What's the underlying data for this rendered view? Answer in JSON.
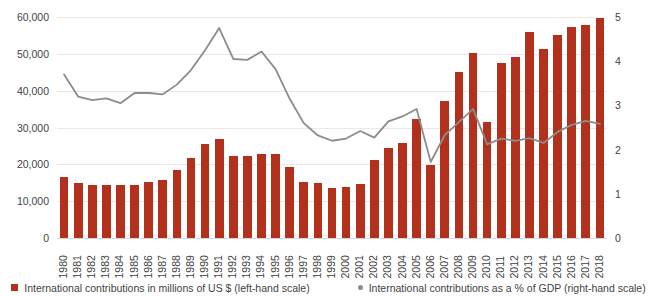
{
  "chart_data": {
    "type": "bar",
    "title": "",
    "xlabel": "",
    "ylabel": "",
    "grid": true,
    "legend_position": "bottom",
    "categories": [
      "1980",
      "1981",
      "1982",
      "1983",
      "1984",
      "1985",
      "1986",
      "1987",
      "1988",
      "1989",
      "1990",
      "1991",
      "1992",
      "1993",
      "1994",
      "1995",
      "1996",
      "1997",
      "1998",
      "1999",
      "2000",
      "2001",
      "2002",
      "2003",
      "2004",
      "2005",
      "2006",
      "2007",
      "2008",
      "2009",
      "2010",
      "2011",
      "2012",
      "2013",
      "2014",
      "2015",
      "2016",
      "2017",
      "2018"
    ],
    "axes": {
      "left": {
        "label": "International contributions in millions of US $",
        "ticks": [
          "0",
          "10,000",
          "20,000",
          "30,000",
          "40,000",
          "50,000",
          "60,000"
        ],
        "tick_values": [
          0,
          10000,
          20000,
          30000,
          40000,
          50000,
          60000
        ],
        "ylim": [
          0,
          60000
        ]
      },
      "right": {
        "label": "International contributions as a % of GDP",
        "ticks": [
          "0",
          "1",
          "2",
          "3",
          "4",
          "5"
        ],
        "tick_values": [
          0,
          1,
          2,
          3,
          4,
          5
        ],
        "ylim": [
          0,
          5
        ]
      }
    },
    "series": [
      {
        "name": "International contributions in millions of US $ (left-hand scale)",
        "type": "bar",
        "axis": "left",
        "color": "#b3301c",
        "values": [
          16600,
          14900,
          14500,
          14400,
          14300,
          14500,
          15300,
          15800,
          18600,
          21700,
          25400,
          27000,
          22400,
          22400,
          22800,
          22700,
          19300,
          15300,
          15000,
          13700,
          13800,
          14600,
          21300,
          24400,
          25800,
          32300,
          19700,
          37200,
          45100,
          50300,
          31600,
          47500,
          49100,
          55900,
          51400,
          55000,
          57300,
          57900,
          59800
        ]
      },
      {
        "name": "International contributions as a % of GDP (right-hand scale)",
        "type": "line",
        "axis": "right",
        "color": "#8c8c8c",
        "values": [
          3.7,
          3.2,
          3.12,
          3.16,
          3.05,
          3.28,
          3.28,
          3.25,
          3.47,
          3.8,
          4.25,
          4.75,
          4.05,
          4.03,
          4.22,
          3.82,
          3.15,
          2.6,
          2.32,
          2.2,
          2.25,
          2.42,
          2.27,
          2.64,
          2.75,
          2.92,
          1.72,
          2.33,
          2.62,
          2.92,
          2.12,
          2.25,
          2.2,
          2.26,
          2.15,
          2.4,
          2.56,
          2.65,
          2.58
        ]
      }
    ]
  },
  "legend": {
    "items": [
      {
        "marker": "square-swatch-icon",
        "label": "International contributions in millions of US $ (left-hand scale)",
        "color": "#b3301c"
      },
      {
        "marker": "dot-swatch-icon",
        "label": "International contributions as a % of GDP (right-hand scale)",
        "color": "#8c8c8c"
      }
    ]
  }
}
